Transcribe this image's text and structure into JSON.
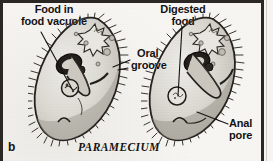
{
  "figure": {
    "caption_letter": "b",
    "organism_name": "PARAMECIUM",
    "background_color": "#f6f5f2",
    "frame_color": "#2a2724",
    "ink_color": "#131110"
  },
  "labels": {
    "food_in_vacuole": {
      "line1": "Food in",
      "line2": "food vacuole"
    },
    "digested_food": {
      "line1": "Digested",
      "line2": "food"
    },
    "oral_groove": {
      "line1": "Oral",
      "line2": "groove"
    },
    "anal_pore": {
      "line1": "Anal",
      "line2": "pore"
    }
  },
  "organisms": [
    {
      "name": "paramecium-left",
      "structures": [
        "cilia",
        "pellicle",
        "contractile-vacuole",
        "macronucleus",
        "micronucleus",
        "oral-groove",
        "food-vacuole",
        "cytopharynx"
      ]
    },
    {
      "name": "paramecium-right",
      "structures": [
        "cilia",
        "pellicle",
        "contractile-vacuole",
        "macronucleus",
        "micronucleus",
        "oral-groove",
        "digested-food-vacuole",
        "anal-pore"
      ]
    }
  ]
}
